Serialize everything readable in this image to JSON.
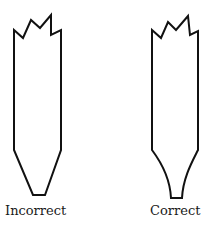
{
  "figure": {
    "stroke_color": "#111111",
    "background": "#ffffff",
    "shapes": [
      {
        "id": "left",
        "label": "Incorrect",
        "description": "straight-tapered broken tip"
      },
      {
        "id": "right",
        "label": "Correct",
        "description": "concave-curved tapered broken tip"
      }
    ]
  }
}
